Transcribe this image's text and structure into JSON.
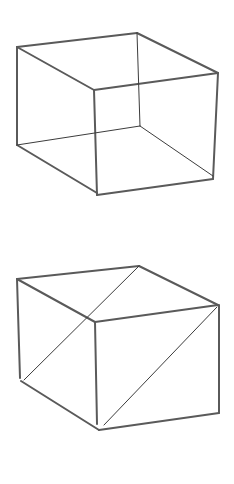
{
  "figures": [
    {
      "name": "wireframe-cube-hidden-edges",
      "description": "Hand-sketched cube showing hidden back edges",
      "edges": [
        {
          "x1": 17,
          "y1": 47,
          "x2": 137,
          "y2": 33,
          "style": "edge"
        },
        {
          "x1": 137,
          "y1": 33,
          "x2": 218,
          "y2": 73,
          "style": "edge"
        },
        {
          "x1": 17,
          "y1": 47,
          "x2": 94,
          "y2": 90,
          "style": "edge"
        },
        {
          "x1": 94,
          "y1": 90,
          "x2": 218,
          "y2": 73,
          "style": "edge"
        },
        {
          "x1": 17,
          "y1": 47,
          "x2": 17,
          "y2": 145,
          "style": "edge"
        },
        {
          "x1": 94,
          "y1": 90,
          "x2": 97,
          "y2": 195,
          "style": "edge"
        },
        {
          "x1": 218,
          "y1": 73,
          "x2": 213,
          "y2": 179,
          "style": "edge"
        },
        {
          "x1": 17,
          "y1": 145,
          "x2": 97,
          "y2": 193,
          "style": "edge"
        },
        {
          "x1": 97,
          "y1": 195,
          "x2": 213,
          "y2": 179,
          "style": "edge"
        },
        {
          "x1": 137,
          "y1": 33,
          "x2": 140,
          "y2": 126,
          "style": "thin"
        },
        {
          "x1": 17,
          "y1": 145,
          "x2": 140,
          "y2": 126,
          "style": "thin"
        },
        {
          "x1": 140,
          "y1": 126,
          "x2": 213,
          "y2": 176,
          "style": "thin"
        }
      ]
    },
    {
      "name": "solid-cube-with-diagonals",
      "description": "Hand-sketched cube with two parallel face diagonals",
      "edges": [
        {
          "x1": 17,
          "y1": 279,
          "x2": 139,
          "y2": 266,
          "style": "edge"
        },
        {
          "x1": 139,
          "y1": 266,
          "x2": 218,
          "y2": 305,
          "style": "edge"
        },
        {
          "x1": 17,
          "y1": 279,
          "x2": 95,
          "y2": 322,
          "style": "edge"
        },
        {
          "x1": 95,
          "y1": 322,
          "x2": 218,
          "y2": 305,
          "style": "edge"
        },
        {
          "x1": 17,
          "y1": 279,
          "x2": 20,
          "y2": 378,
          "style": "edge"
        },
        {
          "x1": 95,
          "y1": 322,
          "x2": 97,
          "y2": 424,
          "style": "edge"
        },
        {
          "x1": 219,
          "y1": 305,
          "x2": 219,
          "y2": 413,
          "style": "edge"
        },
        {
          "x1": 21,
          "y1": 381,
          "x2": 99,
          "y2": 430,
          "style": "edge"
        },
        {
          "x1": 99,
          "y1": 430,
          "x2": 219,
          "y2": 413,
          "style": "edge"
        },
        {
          "x1": 139,
          "y1": 266,
          "x2": 24,
          "y2": 380,
          "style": "thin"
        },
        {
          "x1": 217,
          "y1": 307,
          "x2": 104,
          "y2": 425,
          "style": "thin"
        }
      ]
    }
  ]
}
